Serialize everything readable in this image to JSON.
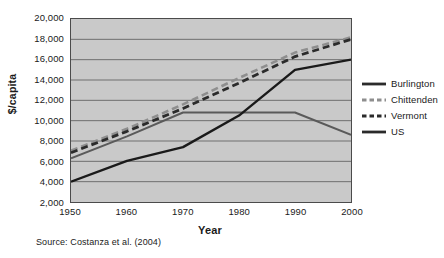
{
  "chart_data": {
    "type": "line",
    "title": "",
    "xlabel": "Year",
    "ylabel": "$/capita",
    "x": [
      1950,
      1960,
      1970,
      1980,
      1990,
      2000
    ],
    "xlim": [
      1950,
      2000
    ],
    "ylim": [
      2000,
      20000
    ],
    "xticks": [
      "1950",
      "1960",
      "1970",
      "1980",
      "1990",
      "2000"
    ],
    "yticks": [
      "2,000",
      "4,000",
      "6,000",
      "8,000",
      "10,000",
      "12,000",
      "14,000",
      "16,000",
      "18,000",
      "20,000"
    ],
    "ytick_values": [
      2000,
      4000,
      6000,
      8000,
      10000,
      12000,
      14000,
      16000,
      18000,
      20000
    ],
    "grid": true,
    "grid_axis": "y",
    "legend_position": "right",
    "plot_background": "#c9c9c9",
    "series": [
      {
        "name": "Burlington",
        "style": "solid",
        "color": "#5a5a5a",
        "width": 2,
        "values": [
          6300,
          8450,
          10800,
          10800,
          10800,
          8600
        ]
      },
      {
        "name": "Chittenden",
        "style": "dashed",
        "color": "#8e8e8e",
        "width": 2.6,
        "values": [
          7050,
          9200,
          11600,
          14200,
          16700,
          18200
        ]
      },
      {
        "name": "Vermont",
        "style": "dashed",
        "color": "#2b2b2b",
        "width": 2.8,
        "values": [
          6850,
          8950,
          11200,
          13700,
          16300,
          18000
        ]
      },
      {
        "name": "US",
        "style": "solid",
        "color": "#1a1a1a",
        "width": 2.4,
        "values": [
          4000,
          6050,
          7400,
          10500,
          15000,
          16000
        ]
      }
    ]
  },
  "legend": {
    "items": [
      {
        "label": "Burlington",
        "style": "solid",
        "color": "#2b2b2b"
      },
      {
        "label": "Chittenden",
        "style": "dashed",
        "color": "#8e8e8e"
      },
      {
        "label": "Vermont",
        "style": "dashed",
        "color": "#2b2b2b"
      },
      {
        "label": "US",
        "style": "solid",
        "color": "#2b2b2b"
      }
    ]
  },
  "source": {
    "text": "Source: Costanza et al. (2004)"
  }
}
